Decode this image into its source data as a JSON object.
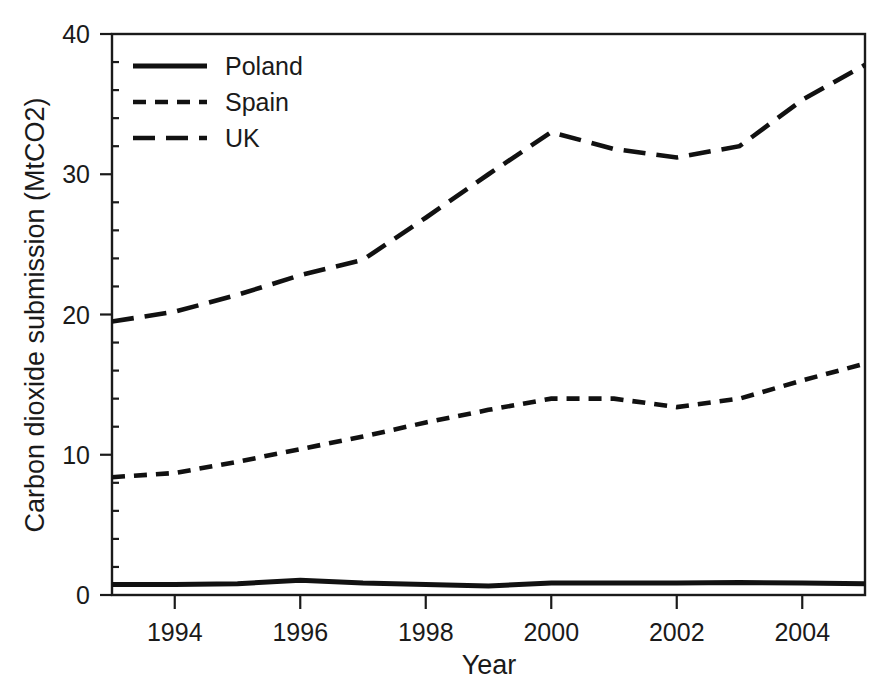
{
  "figure": {
    "width": 884,
    "height": 698,
    "background": "#ffffff",
    "ink_color": "#111111"
  },
  "chart_data": {
    "type": "line",
    "title": "",
    "xlabel": "Year",
    "ylabel": "Carbon dioxide submission (MtCO2)",
    "x": [
      1993,
      1994,
      1995,
      1996,
      1997,
      1998,
      1999,
      2000,
      2001,
      2002,
      2003,
      2004,
      2005
    ],
    "xlim": [
      1993,
      2005
    ],
    "ylim": [
      0,
      40
    ],
    "xticks": [
      1994,
      1996,
      1998,
      2000,
      2002,
      2004
    ],
    "xticklabels": [
      "1994",
      "1996",
      "1998",
      "2000",
      "2002",
      "2004"
    ],
    "yticks": [
      0,
      10,
      20,
      30,
      40
    ],
    "yticklabels": [
      "0",
      "10",
      "20",
      "30",
      "40"
    ],
    "grid": false,
    "legend_position": "upper left",
    "series": [
      {
        "name": "Poland",
        "style": "solid",
        "color": "#111111",
        "values": [
          0.75,
          0.75,
          0.8,
          1.05,
          0.85,
          0.75,
          0.65,
          0.85,
          0.85,
          0.85,
          0.9,
          0.85,
          0.8
        ]
      },
      {
        "name": "Spain",
        "style": "dashed-short",
        "color": "#111111",
        "values": [
          8.4,
          8.7,
          9.5,
          10.4,
          11.3,
          12.3,
          13.2,
          14.0,
          14.0,
          13.4,
          14.0,
          15.3,
          16.5
        ]
      },
      {
        "name": "UK",
        "style": "dashed-long",
        "color": "#111111",
        "values": [
          19.5,
          20.2,
          21.4,
          22.8,
          23.9,
          26.9,
          30.0,
          33.0,
          31.8,
          31.2,
          32.0,
          35.3,
          37.8
        ]
      }
    ]
  },
  "legend": {
    "entries": [
      {
        "label": "Poland",
        "style": "solid"
      },
      {
        "label": "Spain",
        "style": "dashed-short"
      },
      {
        "label": "UK",
        "style": "dashed-long"
      }
    ]
  }
}
